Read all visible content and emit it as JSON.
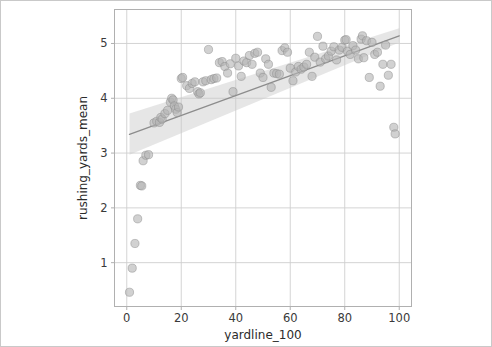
{
  "figure": {
    "background_color": "#ffffff",
    "border_color": "#c9c9c9",
    "axes_color": "#b0b0b0",
    "grid_color": "#cfcfcf"
  },
  "chart_data": {
    "type": "scatter",
    "title": "",
    "subtitle": "",
    "xlabel": "yardline_100",
    "ylabel": "rushing_yards_mean",
    "xlim": [
      -4.5,
      104.5
    ],
    "ylim": [
      0.2,
      5.62
    ],
    "xticks": [
      0,
      20,
      40,
      60,
      80,
      100
    ],
    "xticklabels": [
      "0",
      "20",
      "40",
      "60",
      "80",
      "100"
    ],
    "yticks": [
      1,
      2,
      3,
      4,
      5
    ],
    "yticklabels": [
      "1",
      "2",
      "3",
      "4",
      "5"
    ],
    "grid": true,
    "grid_axis": "both",
    "legend": false,
    "legend_position": "none",
    "marker": {
      "shape": "circle",
      "size_px": 4.1,
      "fill_color": "#b4b4b4",
      "edge_color": "#8a8a8a",
      "opacity": 0.62
    },
    "regression": {
      "type": "linear",
      "line_color": "#8c8c8c",
      "line_width": 1.3,
      "band_color": "#c8c8c8",
      "band_opacity": 0.45,
      "x_start": 1,
      "x_end": 100,
      "y_start": 3.34,
      "y_end": 5.14,
      "slope": 0.01818,
      "intercept": 3.322,
      "ci_lower_start": 2.97,
      "ci_upper_start": 3.72,
      "ci_lower_end": 5.02,
      "ci_upper_end": 5.28
    },
    "series": [
      {
        "name": "rushing_yards_mean vs yardline_100",
        "points": [
          [
            1,
            0.46
          ],
          [
            2,
            0.9
          ],
          [
            3,
            1.35
          ],
          [
            4,
            1.8
          ],
          [
            5,
            2.41
          ],
          [
            5.5,
            2.4
          ],
          [
            6,
            2.86
          ],
          [
            7,
            2.96
          ],
          [
            8,
            2.97
          ],
          [
            10,
            3.55
          ],
          [
            11,
            3.58
          ],
          [
            12,
            3.56
          ],
          [
            12.5,
            3.65
          ],
          [
            13,
            3.62
          ],
          [
            14,
            3.72
          ],
          [
            15,
            3.78
          ],
          [
            16,
            3.93
          ],
          [
            16.5,
            4.0
          ],
          [
            17,
            3.97
          ],
          [
            17.5,
            3.86
          ],
          [
            18,
            3.8
          ],
          [
            18.5,
            3.74
          ],
          [
            19,
            3.84
          ],
          [
            20,
            4.36
          ],
          [
            20.5,
            4.38
          ],
          [
            22,
            4.23
          ],
          [
            23,
            4.18
          ],
          [
            24,
            4.27
          ],
          [
            25,
            4.3
          ],
          [
            26,
            4.12
          ],
          [
            26.5,
            4.08
          ],
          [
            27,
            4.1
          ],
          [
            28,
            4.3
          ],
          [
            29,
            4.32
          ],
          [
            30,
            4.89
          ],
          [
            31,
            4.34
          ],
          [
            32,
            4.36
          ],
          [
            33,
            4.37
          ],
          [
            34,
            4.65
          ],
          [
            35,
            4.67
          ],
          [
            36,
            4.58
          ],
          [
            37,
            4.46
          ],
          [
            38,
            4.63
          ],
          [
            39,
            4.12
          ],
          [
            40,
            4.73
          ],
          [
            41,
            4.59
          ],
          [
            42,
            4.4
          ],
          [
            43,
            4.68
          ],
          [
            44,
            4.65
          ],
          [
            45,
            4.78
          ],
          [
            46,
            4.62
          ],
          [
            47,
            4.82
          ],
          [
            48,
            4.84
          ],
          [
            49,
            4.46
          ],
          [
            50,
            4.38
          ],
          [
            51,
            4.72
          ],
          [
            52,
            4.62
          ],
          [
            53,
            4.2
          ],
          [
            54,
            4.46
          ],
          [
            55,
            4.45
          ],
          [
            56,
            4.44
          ],
          [
            57,
            4.87
          ],
          [
            58,
            4.92
          ],
          [
            59,
            4.84
          ],
          [
            60,
            4.55
          ],
          [
            61,
            4.32
          ],
          [
            62,
            4.48
          ],
          [
            63,
            4.58
          ],
          [
            64,
            4.53
          ],
          [
            65,
            4.57
          ],
          [
            66,
            4.62
          ],
          [
            67,
            4.84
          ],
          [
            68,
            4.4
          ],
          [
            69,
            4.75
          ],
          [
            70,
            5.13
          ],
          [
            71,
            4.66
          ],
          [
            72,
            4.95
          ],
          [
            73,
            4.72
          ],
          [
            74,
            4.77
          ],
          [
            75,
            4.86
          ],
          [
            76,
            4.94
          ],
          [
            77,
            4.7
          ],
          [
            78,
            4.88
          ],
          [
            79,
            4.93
          ],
          [
            80,
            5.06
          ],
          [
            80.5,
            5.07
          ],
          [
            81,
            4.86
          ],
          [
            82,
            4.8
          ],
          [
            83,
            4.96
          ],
          [
            84,
            4.88
          ],
          [
            85,
            4.72
          ],
          [
            86,
            5.08
          ],
          [
            86.5,
            5.14
          ],
          [
            87,
            4.74
          ],
          [
            88,
            5.05
          ],
          [
            89,
            4.38
          ],
          [
            90,
            5.02
          ],
          [
            91,
            4.8
          ],
          [
            92,
            4.84
          ],
          [
            93,
            4.22
          ],
          [
            94,
            4.62
          ],
          [
            95,
            4.97
          ],
          [
            96,
            4.42
          ],
          [
            97,
            4.62
          ],
          [
            98,
            3.47
          ],
          [
            98.5,
            3.35
          ]
        ]
      }
    ]
  }
}
